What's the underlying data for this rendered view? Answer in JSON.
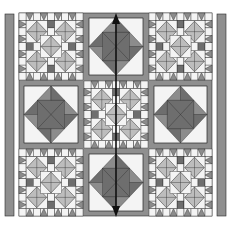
{
  "figure": {
    "colors": {
      "background": "#ffffff",
      "dark": "#6e6e6e",
      "medium": "#8c8c8c",
      "light": "#bdbdbd",
      "white": "#f4f4f4",
      "line": "#2a2a2a",
      "sashing": "#8f8f8f",
      "arrow": "#111111"
    },
    "grid": {
      "rows": 3,
      "cols": 3
    },
    "blocks": [
      {
        "row": 0,
        "col": 0,
        "type": "diamond-star"
      },
      {
        "row": 0,
        "col": 1,
        "type": "sawtooth-star"
      },
      {
        "row": 0,
        "col": 2,
        "type": "diamond-star"
      },
      {
        "row": 1,
        "col": 0,
        "type": "sawtooth-star"
      },
      {
        "row": 1,
        "col": 1,
        "type": "diamond-star"
      },
      {
        "row": 1,
        "col": 2,
        "type": "sawtooth-star"
      },
      {
        "row": 2,
        "col": 0,
        "type": "diamond-star"
      },
      {
        "row": 2,
        "col": 1,
        "type": "sawtooth-star"
      },
      {
        "row": 2,
        "col": 2,
        "type": "diamond-star"
      }
    ],
    "borders": [
      "left-strip",
      "right-strip"
    ],
    "arrow": {
      "direction": "vertical",
      "double_headed": true
    }
  }
}
